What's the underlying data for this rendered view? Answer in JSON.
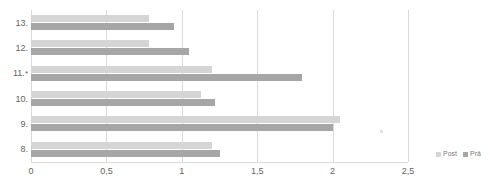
{
  "chart_data": {
    "type": "bar",
    "orientation": "horizontal",
    "title": "",
    "xlabel": "",
    "ylabel": "",
    "categories": [
      "13.",
      "12.",
      "11.",
      "10.",
      "9.",
      "8."
    ],
    "category_markers": [
      "",
      "",
      "*",
      "",
      "",
      ""
    ],
    "series": [
      {
        "name": "Post",
        "color": "#d5d5d5",
        "values": [
          0.78,
          0.78,
          1.2,
          1.13,
          2.05,
          1.2
        ]
      },
      {
        "name": "Prä",
        "color": "#a6a6a6",
        "values": [
          0.95,
          1.05,
          1.8,
          1.22,
          2.0,
          1.25
        ]
      }
    ],
    "xlim": [
      0,
      2.5
    ],
    "xticks": [
      0,
      0.5,
      1,
      1.5,
      2,
      2.5
    ],
    "xticklabels": [
      "0",
      "0,5",
      "1",
      "1,5",
      "2",
      "2,5"
    ],
    "grid": true,
    "grid_axis": "x",
    "legend_position": "bottom-right"
  },
  "legend": {
    "entries": [
      {
        "label": "Post",
        "color": "#d5d5d5"
      },
      {
        "label": "Prä",
        "color": "#a6a6a6"
      }
    ]
  },
  "colors": {
    "series_post": "#d5d5d5",
    "series_prae": "#a6a6a6",
    "gridline": "#d9d9d9",
    "text": "#636363",
    "background": "#ffffff"
  }
}
